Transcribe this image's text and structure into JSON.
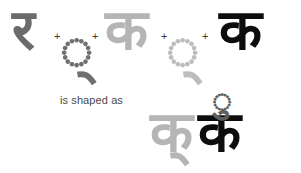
{
  "figure": {
    "background_color": "#ffffff",
    "caption": "is shaped as",
    "operator": "+",
    "colors": {
      "ra_dark_gray": "#6b6b6b",
      "ka_light_gray": "#b5b5b5",
      "ka_black": "#0d0d0d",
      "virama_gray": "#707070",
      "repha_gray": "#5e5e5e",
      "caption_text": "#4a4a4a"
    }
  },
  "input_sequence": {
    "items": [
      {
        "glyph": "र",
        "name": "ra",
        "color": "#6b6b6b"
      },
      {
        "glyph": "्",
        "name": "virama",
        "color": "#707070"
      },
      {
        "glyph": "क",
        "name": "ka",
        "color": "#b5b5b5"
      },
      {
        "glyph": "्",
        "name": "virama",
        "color": "#bdbdbd"
      },
      {
        "glyph": "क",
        "name": "ka",
        "color": "#0d0d0d"
      }
    ],
    "operators": [
      "+",
      "+",
      "+",
      "+"
    ]
  },
  "result": {
    "half_ka": "क्",
    "full_ka": "क",
    "repha": "र्",
    "repha_glyph": "ु"
  }
}
